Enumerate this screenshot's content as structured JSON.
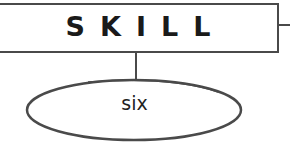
{
  "diagram": {
    "root": {
      "label": "SKILL"
    },
    "child": {
      "label": "six"
    },
    "colors": {
      "stroke": "#4a4a4a",
      "text": "#1a1a1a",
      "background": "#ffffff"
    }
  }
}
